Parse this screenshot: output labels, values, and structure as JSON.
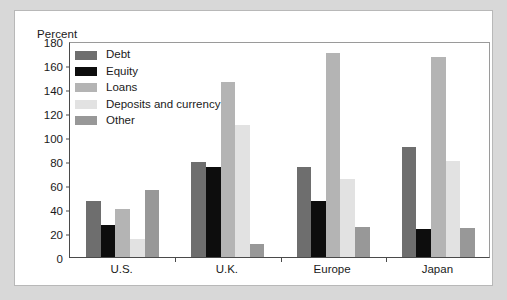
{
  "chart_data": {
    "type": "bar",
    "title": "",
    "subtitle": "",
    "xlabel": "",
    "ylabel": "Percent",
    "ylim": [
      0,
      180
    ],
    "ytick_step": 20,
    "yticks": [
      180,
      160,
      140,
      120,
      100,
      80,
      60,
      40,
      20,
      0
    ],
    "grid": false,
    "legend_position": "top-left inside plot",
    "categories": [
      "U.S.",
      "U.K.",
      "Europe",
      "Japan"
    ],
    "series": [
      {
        "name": "Debt",
        "color": "#6e6e6e",
        "values": [
          47,
          79,
          75,
          92
        ]
      },
      {
        "name": "Equity",
        "color": "#0d0d0d",
        "values": [
          27,
          75,
          47,
          23
        ]
      },
      {
        "name": "Loans",
        "color": "#b4b4b4",
        "values": [
          40,
          146,
          170,
          167
        ]
      },
      {
        "name": "Deposits and currency",
        "color": "#e2e2e2",
        "values": [
          15,
          110,
          65,
          80
        ]
      },
      {
        "name": "Other",
        "color": "#989898",
        "values": [
          56,
          11,
          25,
          24
        ]
      }
    ]
  },
  "figure": {
    "background_color": "#d8d8d8",
    "panel_color": "#ffffff",
    "axis_color": "#4a4a4a"
  }
}
